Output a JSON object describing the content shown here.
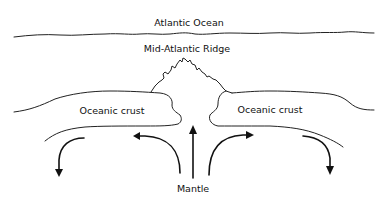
{
  "diagram": {
    "labels": {
      "ocean": "Atlantic Ocean",
      "ridge": "Mid-Atlantic Ridge",
      "crust_left": "Oceanic crust",
      "crust_right": "Oceanic crust",
      "mantle": "Mantle"
    },
    "colors": {
      "background": "#ffffff",
      "stroke": "#222222",
      "text": "#111111"
    },
    "arrows": [
      {
        "name": "outer-left-down",
        "direction": "down"
      },
      {
        "name": "inner-left",
        "direction": "left"
      },
      {
        "name": "center-up",
        "direction": "up"
      },
      {
        "name": "inner-right",
        "direction": "right"
      },
      {
        "name": "outer-right-down",
        "direction": "down"
      }
    ]
  }
}
